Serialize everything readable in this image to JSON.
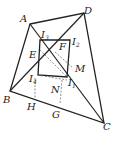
{
  "diagram": {
    "type": "geometry",
    "points": {
      "A": {
        "label": "A",
        "x": 30,
        "y": 24
      },
      "D": {
        "label": "D",
        "x": 84,
        "y": 13
      },
      "B": {
        "label": "B",
        "x": 10,
        "y": 91
      },
      "C": {
        "label": "C",
        "x": 104,
        "y": 123
      },
      "I1": {
        "label": "I",
        "sub": "1",
        "x": 67,
        "y": 77
      },
      "I2": {
        "label": "I",
        "sub": "2",
        "x": 70,
        "y": 40
      },
      "I3": {
        "label": "I",
        "sub": "3",
        "x": 40,
        "y": 40
      },
      "I4": {
        "label": "I",
        "sub": "4",
        "x": 38,
        "y": 75
      },
      "E": {
        "label": "E"
      },
      "F": {
        "label": "F"
      },
      "M": {
        "label": "M"
      },
      "N": {
        "label": "N"
      },
      "H": {
        "label": "H",
        "x": 35,
        "y": 100
      },
      "G": {
        "label": "G",
        "x": 60,
        "y": 104
      }
    }
  }
}
